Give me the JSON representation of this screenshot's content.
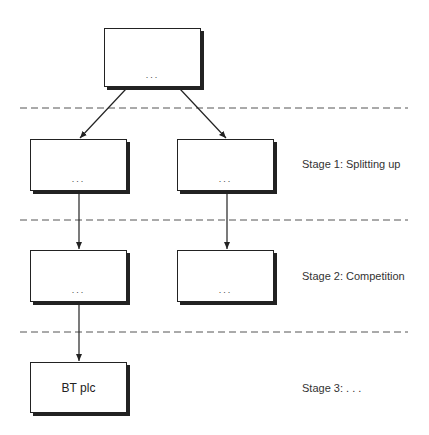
{
  "diagram": {
    "boxes": {
      "top": {
        "text": "..."
      },
      "stage1_left": {
        "text": "..."
      },
      "stage1_right": {
        "text": "..."
      },
      "stage2_left": {
        "text": "..."
      },
      "stage2_right": {
        "text": "..."
      },
      "stage3": {
        "text": "BT plc"
      }
    },
    "stages": [
      {
        "label": "Stage 1: Splitting up"
      },
      {
        "label": "Stage 2: Competition"
      },
      {
        "label": "Stage 3: . . ."
      }
    ],
    "colors": {
      "line": "#222222",
      "dashed_divider": "#555555",
      "background": "#ffffff"
    }
  }
}
